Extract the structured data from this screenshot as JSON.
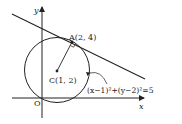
{
  "diagram": {
    "axes": {
      "x_label": "x",
      "y_label": "y",
      "origin_label": "O"
    },
    "circle": {
      "center_label": "C(1, 2)",
      "equation": "(x−1)²+(y−2)²=5"
    },
    "tangent_point": {
      "label": "A(2, 4)"
    },
    "colors": {
      "stroke": "#222222",
      "background": "#ffffff"
    }
  }
}
